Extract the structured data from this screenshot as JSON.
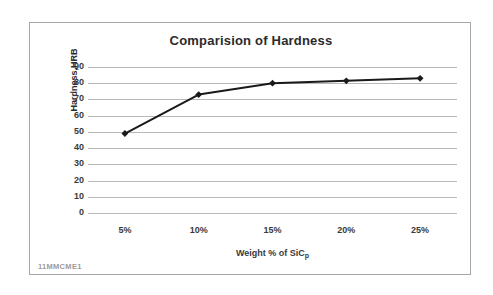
{
  "chart_data": {
    "type": "line",
    "title": "Comparision of Hardness",
    "xlabel": "Weight % of SiC",
    "xlabel_subscript": "p",
    "ylabel": "Hardness,HRB",
    "categories": [
      "5%",
      "10%",
      "15%",
      "20%",
      "25%"
    ],
    "values": [
      49,
      73,
      80,
      81.5,
      83
    ],
    "series": [
      {
        "name": "Hardness",
        "values": [
          49,
          73,
          80,
          81.5,
          83
        ],
        "line_color": "#1a1a1a",
        "marker": "diamond"
      }
    ],
    "ylim": [
      0,
      90
    ],
    "ytick_labels": [
      "90",
      "80",
      "70",
      "60",
      "50",
      "40",
      "30",
      "20",
      "10",
      "0"
    ],
    "ytick_values": [
      90,
      80,
      70,
      60,
      50,
      40,
      30,
      20,
      10,
      0
    ],
    "grid": true,
    "grid_color": "#b9b9b9",
    "legend": "none",
    "plot_background": "#ffffff"
  },
  "frame": {
    "border_color": "#a6a6a6"
  },
  "footer": {
    "note": "11MMCME1"
  }
}
